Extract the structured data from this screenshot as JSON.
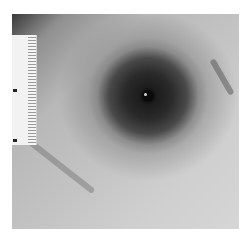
{
  "image": {
    "description": "Grayscale clinical photograph of skin showing a dense circular pattern of dark stippling around a small central wound, with a measuring ruler at left",
    "subject": "stippling pattern around central wound",
    "scale_reference": "ruler",
    "colors": {
      "background": "#ffffff",
      "skin_light": "#cfcfcf",
      "stippling_dark": "#1a1a1a",
      "ruler": "#f2f2f2"
    }
  }
}
